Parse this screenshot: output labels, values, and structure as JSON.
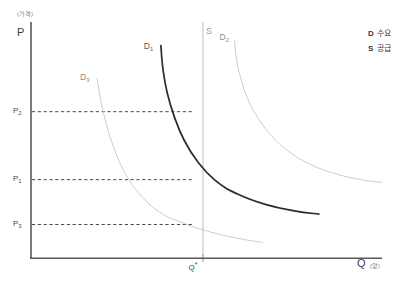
{
  "chart_data": {
    "type": "line",
    "title": "",
    "subtitle": "",
    "xlabel": "Q",
    "xlabel_unit": "(양)",
    "ylabel": "P",
    "ylabel_unit": "(가격)",
    "grid": false,
    "legend_position": "top-right",
    "xlim": [
      0,
      100
    ],
    "ylim": [
      0,
      100
    ],
    "annotations": [
      "D₃ curve crosses supply line S at price P₃",
      "D₁ curve crosses supply line S at price P₁",
      "D₂ curve crosses supply line S at price P₂",
      "Supply is perfectly inelastic (vertical) at quantity Q*"
    ],
    "x_ticks": [
      {
        "label": "Q",
        "sup": "*",
        "value": 46.3
      }
    ],
    "y_ticks": [
      {
        "label": "P",
        "sub": "2",
        "value": 62.0
      },
      {
        "label": "P",
        "sub": "1",
        "value": 33.2
      },
      {
        "label": "P",
        "sub": "3",
        "value": 14.2
      }
    ],
    "series": [
      {
        "name": "D",
        "sub": "3",
        "label": "D₃",
        "color": "#cccccc",
        "width": 1,
        "emphasis": false,
        "points": [
          [
            18.8,
            76.0
          ],
          [
            20.0,
            66.0
          ],
          [
            21.6,
            56.0
          ],
          [
            23.8,
            46.0
          ],
          [
            26.8,
            36.0
          ],
          [
            31.0,
            27.0
          ],
          [
            36.6,
            19.5
          ],
          [
            43.0,
            15.0
          ],
          [
            50.0,
            11.5
          ],
          [
            58.0,
            8.6
          ],
          [
            66.0,
            6.6
          ]
        ]
      },
      {
        "name": "D",
        "sub": "1",
        "label": "D₁",
        "color": "#2b2b2b",
        "width": 1.7,
        "emphasis": true,
        "points": [
          [
            37.0,
            90.0
          ],
          [
            37.6,
            80.0
          ],
          [
            38.8,
            70.0
          ],
          [
            40.8,
            60.0
          ],
          [
            43.6,
            50.0
          ],
          [
            47.4,
            41.0
          ],
          [
            52.4,
            33.0
          ],
          [
            59.0,
            27.0
          ],
          [
            67.0,
            22.6
          ],
          [
            75.0,
            20.0
          ],
          [
            82.0,
            18.6
          ]
        ]
      },
      {
        "name": "D",
        "sub": "2",
        "label": "D₂",
        "color": "#cccccc",
        "width": 1,
        "emphasis": false,
        "points": [
          [
            58.0,
            92.0
          ],
          [
            58.6,
            84.0
          ],
          [
            59.8,
            76.0
          ],
          [
            61.6,
            68.0
          ],
          [
            64.4,
            60.0
          ],
          [
            68.4,
            52.0
          ],
          [
            73.6,
            45.0
          ],
          [
            80.0,
            39.4
          ],
          [
            87.0,
            35.6
          ],
          [
            94.0,
            33.2
          ],
          [
            100.0,
            32.0
          ]
        ]
      }
    ],
    "supply": {
      "name": "S",
      "label": "S",
      "color": "#c4c4c4",
      "type": "vertical",
      "x_value": 46.3,
      "description": "Perfectly inelastic vertical supply curve"
    },
    "dashed_lines": [
      {
        "from_tick": "P₂",
        "to_curve": "D₂",
        "y_value": 62.0
      },
      {
        "from_tick": "P₁",
        "to_curve": "D₁",
        "y_value": 33.2
      },
      {
        "from_tick": "P₃",
        "to_curve": "D₃",
        "y_value": 14.2
      }
    ],
    "legend": [
      {
        "key": "D",
        "text": "수요"
      },
      {
        "key": "S",
        "text": "공급"
      }
    ]
  }
}
